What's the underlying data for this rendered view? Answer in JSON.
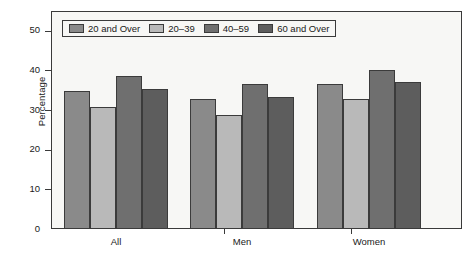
{
  "chart_data": {
    "type": "bar",
    "title": "",
    "subtitle": "",
    "xlabel": "",
    "ylabel": "Percentage",
    "categories": [
      "All",
      "Men",
      "Women"
    ],
    "series": [
      {
        "name": "20 and Over",
        "values": [
          34.7,
          32.8,
          36.7
        ],
        "color": "#8a8a8a"
      },
      {
        "name": "20–39",
        "values": [
          30.9,
          28.8,
          32.8
        ],
        "color": "#b9b9b9"
      },
      {
        "name": "40–59",
        "values": [
          38.5,
          36.7,
          40.2
        ],
        "color": "#6f6f6f"
      },
      {
        "name": "60 and Over",
        "values": [
          35.2,
          33.3,
          37.0
        ],
        "color": "#5d5d5d"
      }
    ],
    "ylim": [
      0,
      55
    ],
    "yticks": [
      0,
      10,
      20,
      30,
      40,
      50
    ],
    "ytick_labels": [
      "0",
      "10",
      "20",
      "30",
      "40",
      "50"
    ],
    "grid": false,
    "legend_position": "top-left",
    "frame_color": "#3a3a3a",
    "plot_background": "#f7f7f5",
    "bar_border_color": "#3b3b3b"
  }
}
